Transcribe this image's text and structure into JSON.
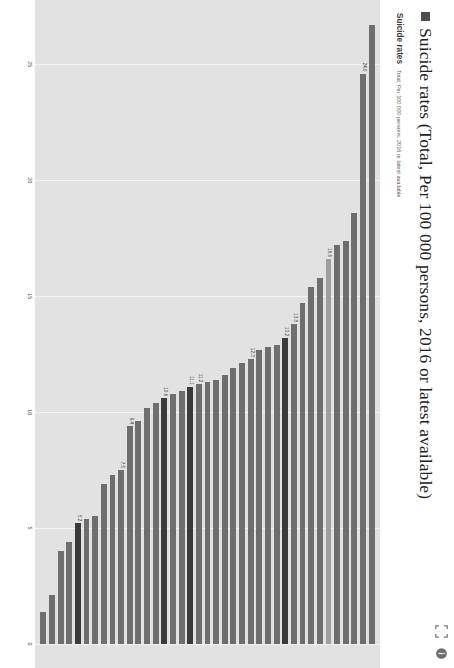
{
  "header": {
    "square_marker": "filled-square",
    "title": "Suicide rates (Total, Per 100 000 persons, 2016 or latest available)",
    "sub_title": "Suicide rates",
    "sub_meta": "Total, Per 100 000 persons, 2016 or latest available",
    "tools": [
      {
        "name": "fullscreen-icon",
        "glyph": "expand"
      },
      {
        "name": "info-icon",
        "glyph": "info"
      }
    ]
  },
  "colors": {
    "plot_background": "#e2e2e2",
    "gridline": "#f3f3f3",
    "bar_default": "#6e6e6e",
    "bar_highlight_light": "#9e9e9e",
    "bar_highlight_dark": "#3a3a3a",
    "title_text": "#222222"
  },
  "chart_data": {
    "type": "bar",
    "orientation": "horizontal",
    "title": "Suicide rates (Total, Per 100 000 persons, 2016 or latest available)",
    "xlabel": "",
    "ylabel": "",
    "xlim": [
      0,
      27
    ],
    "xticks": [
      25,
      20,
      15,
      10,
      5,
      0
    ],
    "axis_direction": "reversed",
    "grid": true,
    "legend": "none",
    "categories": [
      "Lithuania",
      "Korea",
      "Slovenia",
      "Latvia",
      "Hungary",
      "Japan",
      "Belgium",
      "Estonia",
      "Poland",
      "Finland",
      "France",
      "Czech Republic",
      "Austria",
      "United States",
      "Switzerland",
      "Iceland",
      "Croatia",
      "New Zealand",
      "Sweden",
      "Luxembourg",
      "Germany",
      "Australia",
      "Slovak Republic",
      "Canada",
      "Ireland",
      "Denmark",
      "Netherlands",
      "Portugal",
      "Norway",
      "Spain",
      "United Kingdom",
      "Chile",
      "Israel",
      "Italy",
      "Colombia",
      "Greece",
      "Mexico",
      "Turkey",
      "South Africa"
    ],
    "values": [
      26.7,
      24.6,
      18.6,
      17.4,
      17.2,
      16.6,
      15.8,
      15.4,
      14.7,
      13.8,
      13.2,
      12.9,
      12.8,
      12.7,
      12.3,
      12.1,
      11.9,
      11.6,
      11.4,
      11.3,
      11.2,
      11.1,
      10.9,
      10.8,
      10.6,
      10.4,
      10.2,
      9.6,
      9.4,
      7.5,
      7.3,
      6.9,
      5.5,
      5.4,
      5.2,
      4.4,
      4.0,
      2.1,
      1.4
    ],
    "value_labels": {
      "1": "24.6",
      "5": "16.6",
      "9": "13.8",
      "10": "13.2",
      "14": "12.3",
      "20": "11.2",
      "21": "11.1",
      "24": "10.6",
      "28": "9.4",
      "29": "7.5",
      "34": "5.2"
    },
    "highlight_light": [
      5
    ],
    "highlight_dark": [
      10,
      21,
      24,
      34
    ]
  }
}
